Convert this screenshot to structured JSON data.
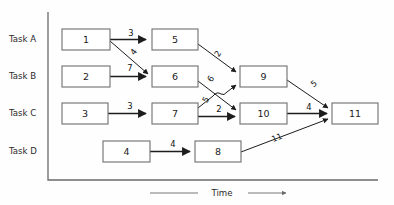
{
  "diagram": {
    "time_axis": {
      "label": "Time",
      "arrow_icon": "right-arrow-icon"
    },
    "rows": [
      {
        "id": "task-a",
        "label": "Task A",
        "y": 39.5
      },
      {
        "id": "task-b",
        "label": "Task B",
        "y": 76.0
      },
      {
        "id": "task-c",
        "label": "Task C",
        "y": 113.5
      },
      {
        "id": "task-d",
        "label": "Task D",
        "y": 151.5
      }
    ],
    "nodes": [
      {
        "id": "n1",
        "label": "1",
        "x": 62,
        "y": 29,
        "w": 48,
        "h": 21,
        "row": "task-a"
      },
      {
        "id": "n5",
        "label": "5",
        "x": 152,
        "y": 29,
        "w": 46,
        "h": 21,
        "row": "task-a"
      },
      {
        "id": "n2",
        "label": "2",
        "x": 62,
        "y": 66,
        "w": 48,
        "h": 21,
        "row": "task-b"
      },
      {
        "id": "n6",
        "label": "6",
        "x": 152,
        "y": 66,
        "w": 46,
        "h": 21,
        "row": "task-b"
      },
      {
        "id": "n9",
        "label": "9",
        "x": 240,
        "y": 66,
        "w": 47,
        "h": 21,
        "row": "task-b"
      },
      {
        "id": "n3",
        "label": "3",
        "x": 62,
        "y": 103,
        "w": 46,
        "h": 21,
        "row": "task-c"
      },
      {
        "id": "n7",
        "label": "7",
        "x": 152,
        "y": 103,
        "w": 46,
        "h": 21,
        "row": "task-c"
      },
      {
        "id": "n10",
        "label": "10",
        "x": 240,
        "y": 103,
        "w": 47,
        "h": 21,
        "row": "task-c"
      },
      {
        "id": "n11",
        "label": "11",
        "x": 332,
        "y": 103,
        "w": 46,
        "h": 21,
        "row": "task-c"
      },
      {
        "id": "n4",
        "label": "4",
        "x": 103,
        "y": 141,
        "w": 47,
        "h": 21,
        "row": "task-d"
      },
      {
        "id": "n8",
        "label": "8",
        "x": 195,
        "y": 141,
        "w": 46,
        "h": 21,
        "row": "task-d"
      }
    ],
    "edges": [
      {
        "id": "e1-5",
        "from": "n1",
        "to": "n5",
        "weight": "3",
        "label_x": 131,
        "label_y": 33,
        "weight_num": 3
      },
      {
        "id": "e1-6",
        "from": "n1",
        "to": "n6",
        "weight": "4",
        "label_x": 134,
        "label_y": 52,
        "weight_num": 4
      },
      {
        "id": "e2-6",
        "from": "n2",
        "to": "n6",
        "weight": "7",
        "label_x": 130,
        "label_y": 68,
        "weight_num": 7
      },
      {
        "id": "e5-9",
        "from": "n5",
        "to": "n9",
        "weight": "2",
        "label_x": 218,
        "label_y": 54,
        "weight_num": 2
      },
      {
        "id": "e6-10",
        "from": "n6",
        "to": "n10",
        "weight": "6",
        "label_x": 212,
        "label_y": 79,
        "weight_num": 6
      },
      {
        "id": "e3-7",
        "from": "n3",
        "to": "n7",
        "weight": "3",
        "label_x": 130,
        "label_y": 106,
        "weight_num": 3
      },
      {
        "id": "e7-9",
        "from": "n7",
        "to": "n9",
        "weight": "5",
        "label_x": 207,
        "label_y": 99,
        "weight_num": 5
      },
      {
        "id": "e7-10",
        "from": "n7",
        "to": "n10",
        "weight": "2",
        "label_x": 220,
        "label_y": 108,
        "weight_num": 2
      },
      {
        "id": "e9-11",
        "from": "n9",
        "to": "n11",
        "weight": "5",
        "label_x": 314,
        "label_y": 83,
        "weight_num": 5
      },
      {
        "id": "e10-11",
        "from": "n10",
        "to": "n11",
        "weight": "4",
        "label_x": 310,
        "label_y": 107,
        "weight_num": 4
      },
      {
        "id": "e4-8",
        "from": "n4",
        "to": "n8",
        "weight": "4",
        "label_x": 173,
        "label_y": 144,
        "weight_num": 4
      },
      {
        "id": "e8-11",
        "from": "n8",
        "to": "n11",
        "weight": "11",
        "label_x": 277,
        "label_y": 138,
        "weight_num": 11
      }
    ],
    "colors": {
      "node_stroke": "#6e6e6e",
      "node_fill": "#ffffff",
      "edge": "#1d1d1d",
      "axis": "#6a6a6a",
      "text": "#1b1b1b",
      "background": "#fefefe"
    }
  }
}
